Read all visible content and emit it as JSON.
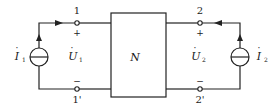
{
  "diagram": {
    "type": "two-port network",
    "network_label": "N",
    "ports": {
      "p1_top": "1",
      "p1_bottom": "1'",
      "p2_top": "2",
      "p2_bottom": "2'"
    },
    "polarity": {
      "p1_plus": "+",
      "p1_minus": "−",
      "p2_plus": "+",
      "p2_minus": "−"
    },
    "sources": {
      "left": {
        "symbol": "I",
        "subscript": "1",
        "dot": "·"
      },
      "right": {
        "symbol": "I",
        "subscript": "2",
        "dot": "·"
      }
    },
    "voltages": {
      "left": {
        "symbol": "U",
        "subscript": "1",
        "dot": "·"
      },
      "right": {
        "symbol": "U",
        "subscript": "2",
        "dot": "·"
      }
    },
    "colors": {
      "stroke": "#222222",
      "background": "#ffffff"
    }
  }
}
